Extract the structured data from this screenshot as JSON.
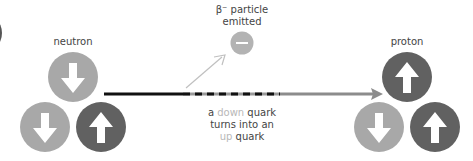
{
  "diagram": {
    "neutron_label": "neutron",
    "proton_label": "proton",
    "beta": {
      "line1": "β⁻ particle",
      "line2": "emitted",
      "symbol": "minus-icon"
    },
    "caption": {
      "a": "a ",
      "down": "down",
      "quark1": " quark",
      "line2": "turns into an",
      "up": "up",
      "quark2": " quark"
    },
    "colors": {
      "down_quark": "#a8a8a8",
      "up_quark": "#616161",
      "beta_particle": "#b3b3b3",
      "line_dark": "#111111",
      "line_light": "#8c8c8c",
      "diagonal_arrow": "#c0c0c0",
      "text": "#444444",
      "text_highlight": "#b8b8b8"
    },
    "neutron_quarks": [
      "down",
      "down",
      "up"
    ],
    "proton_quarks": [
      "up",
      "down",
      "up"
    ]
  }
}
